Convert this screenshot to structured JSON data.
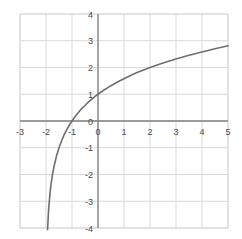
{
  "chart_data": {
    "type": "line",
    "title": "",
    "subtitle": "",
    "xlabel": "",
    "ylabel": "",
    "xlim": [
      -3,
      5
    ],
    "ylim": [
      -4,
      4
    ],
    "xticks": [
      -3,
      -2,
      -1,
      0,
      1,
      2,
      3,
      4,
      5
    ],
    "yticks": [
      4,
      3,
      2,
      1,
      0,
      -1,
      -2,
      -3,
      -4
    ],
    "xtick_labels": [
      "-3",
      "-2",
      "-1",
      "0",
      "1",
      "2",
      "3",
      "4",
      "5"
    ],
    "ytick_labels": [
      "4",
      "3",
      "2",
      "1",
      "0",
      "-1",
      "-2",
      "-3",
      "-4"
    ],
    "grid": true,
    "grid_color": "#d9d9d9",
    "axis_color": "#808080",
    "legend": null,
    "legend_position": "none",
    "annotations": [],
    "series": [
      {
        "name": "y = log2(x + 2)",
        "color": "#6e6e6e",
        "line_width": 1.6,
        "asymptote_x": -2,
        "x_intercept": -1,
        "y_intercept": 1,
        "x": [
          -1.94,
          -1.9,
          -1.85,
          -1.8,
          -1.75,
          -1.7,
          -1.6,
          -1.5,
          -1.4,
          -1.3,
          -1.2,
          -1.1,
          -1.0,
          -0.9,
          -0.8,
          -0.7,
          -0.6,
          -0.5,
          -0.4,
          -0.3,
          -0.2,
          -0.1,
          0.0,
          0.25,
          0.5,
          0.75,
          1.0,
          1.25,
          1.5,
          1.75,
          2.0,
          2.5,
          3.0,
          3.5,
          4.0,
          4.5,
          5.0
        ],
        "y": [
          -4.06,
          -3.32,
          -2.74,
          -2.32,
          -2.0,
          -1.74,
          -1.32,
          -1.0,
          -0.74,
          -0.51,
          -0.32,
          -0.15,
          0.0,
          0.14,
          0.26,
          0.38,
          0.49,
          0.58,
          0.68,
          0.77,
          0.85,
          0.93,
          1.0,
          1.17,
          1.32,
          1.46,
          1.58,
          1.7,
          1.81,
          1.91,
          2.0,
          2.17,
          2.32,
          2.46,
          2.58,
          2.7,
          2.81
        ]
      }
    ]
  },
  "plot_area": {
    "left_px": 20,
    "top_px": 14,
    "right_px": 228,
    "bottom_px": 228,
    "border_color": "#d9d9d9"
  }
}
